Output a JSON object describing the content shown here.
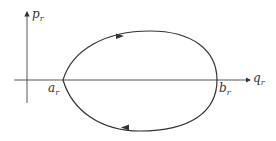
{
  "diagram": {
    "type": "phase-space orbit",
    "axes": {
      "vertical": {
        "label": "p",
        "subscript": "r"
      },
      "horizontal": {
        "label": "q",
        "subscript": "r"
      }
    },
    "points": [
      {
        "label": "a",
        "subscript": "r",
        "position": "left turning point"
      },
      {
        "label": "b",
        "subscript": "r",
        "position": "right turning point"
      }
    ],
    "curve": {
      "shape": "closed egg-shaped loop",
      "direction": "clockwise",
      "color": "#333333"
    }
  }
}
